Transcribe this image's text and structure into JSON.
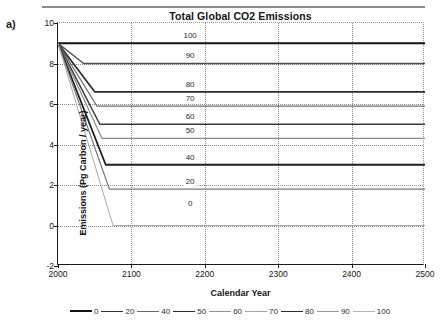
{
  "panel": {
    "label": "a)"
  },
  "chart_data": {
    "type": "line",
    "title": "Total Global CO2 Emissions",
    "xlabel": "Calendar Year",
    "ylabel": "Emissions (Pg Carbon / year)",
    "xlim": [
      2000,
      2500
    ],
    "ylim": [
      -2,
      10
    ],
    "xticks": [
      "2000",
      "2100",
      "2200",
      "2300",
      "2400",
      "2500"
    ],
    "xtick_values": [
      2000,
      2100,
      2200,
      2300,
      2400,
      2500
    ],
    "yticks": [
      "10",
      "8",
      "6",
      "4",
      "2",
      "0",
      "-2"
    ],
    "ytick_values": [
      10,
      8,
      6,
      4,
      2,
      0,
      -2
    ],
    "grid": true,
    "legend_position": "bottom",
    "series": [
      {
        "name": "100",
        "label": "100",
        "color": "#111111",
        "width": 2.2,
        "x": [
          2000,
          2010,
          2500
        ],
        "values": [
          9.0,
          9.0,
          9.0
        ]
      },
      {
        "name": "90",
        "label": "90",
        "color": "#4d4d4d",
        "width": 1.4,
        "x": [
          2000,
          2035,
          2500
        ],
        "values": [
          9.0,
          8.0,
          8.0
        ]
      },
      {
        "name": "80",
        "label": "80",
        "color": "#2b2b2b",
        "width": 1.7,
        "x": [
          2000,
          2050,
          2500
        ],
        "values": [
          9.0,
          6.6,
          6.6
        ]
      },
      {
        "name": "70",
        "label": "70",
        "color": "#6e6e6e",
        "width": 1.3,
        "x": [
          2000,
          2053,
          2500
        ],
        "values": [
          9.0,
          5.9,
          5.9
        ]
      },
      {
        "name": "60",
        "label": "60",
        "color": "#3a3a3a",
        "width": 1.5,
        "x": [
          2000,
          2057,
          2500
        ],
        "values": [
          9.0,
          5.0,
          5.0
        ]
      },
      {
        "name": "50",
        "label": "50",
        "color": "#8a8a8a",
        "width": 1.2,
        "x": [
          2000,
          2060,
          2500
        ],
        "values": [
          9.0,
          4.3,
          4.3
        ]
      },
      {
        "name": "40",
        "label": "40",
        "color": "#1f1f1f",
        "width": 1.8,
        "x": [
          2000,
          2065,
          2500
        ],
        "values": [
          9.0,
          3.0,
          3.0
        ]
      },
      {
        "name": "20",
        "label": "20",
        "color": "#7a7a7a",
        "width": 1.2,
        "x": [
          2000,
          2070,
          2500
        ],
        "values": [
          9.0,
          1.8,
          1.8
        ]
      },
      {
        "name": "0",
        "label": "0",
        "color": "#a8a8a8",
        "width": 1.0,
        "x": [
          2000,
          2075,
          2500
        ],
        "values": [
          9.0,
          0.0,
          0.0
        ]
      }
    ],
    "curve_annotations": [
      {
        "text": "100",
        "x": 2180,
        "y": 9.35
      },
      {
        "text": "90",
        "x": 2180,
        "y": 8.35
      },
      {
        "text": "80",
        "x": 2180,
        "y": 6.95
      },
      {
        "text": "70",
        "x": 2180,
        "y": 6.25
      },
      {
        "text": "60",
        "x": 2180,
        "y": 5.35
      },
      {
        "text": "50",
        "x": 2180,
        "y": 4.65
      },
      {
        "text": "40",
        "x": 2180,
        "y": 3.35
      },
      {
        "text": "20",
        "x": 2180,
        "y": 2.15
      },
      {
        "text": "0",
        "x": 2180,
        "y": 1.05
      }
    ],
    "legend": [
      {
        "label": "0",
        "color": "#111111",
        "width": 2.6
      },
      {
        "label": "20",
        "color": "#333333",
        "width": 1.6
      },
      {
        "label": "40",
        "color": "#6a6a6a",
        "width": 1.3
      },
      {
        "label": "50",
        "color": "#2e2e2e",
        "width": 1.7
      },
      {
        "label": "60",
        "color": "#8f8f8f",
        "width": 1.2
      },
      {
        "label": "70",
        "color": "#a5a5a5",
        "width": 1.1
      },
      {
        "label": "80",
        "color": "#2b2b2b",
        "width": 1.8
      },
      {
        "label": "90",
        "color": "#9b9b9b",
        "width": 1.2
      },
      {
        "label": "100",
        "color": "#b5b5b5",
        "width": 1.0
      }
    ]
  }
}
